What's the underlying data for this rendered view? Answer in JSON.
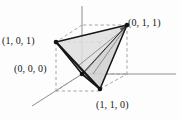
{
  "figure": {
    "type": "3d-geometry-diagram",
    "background_color": "#fdfdfd",
    "edge_color": "#1a1a1a",
    "face_fill": "#dcdcdc",
    "dashed_color": "#9a9a9a",
    "axis_color": "#8d8d8d"
  },
  "labels": {
    "v101": "(1, 0, 1)",
    "v011": "(0, 1, 1)",
    "v000": "(0, 0, 0)",
    "v110": "(1, 1, 0)"
  },
  "vertices": [
    {
      "name": "origin",
      "coord": "(0, 0, 0)",
      "px": [
        82,
        74
      ]
    },
    {
      "name": "top-left",
      "coord": "(1, 0, 1)",
      "px": [
        56,
        42
      ]
    },
    {
      "name": "top-right",
      "coord": "(0, 1, 1)",
      "px": [
        127,
        25
      ]
    },
    {
      "name": "bottom",
      "coord": "(1, 1, 0)",
      "px": [
        100,
        89
      ]
    }
  ],
  "axes": [
    {
      "name": "z-axis",
      "direction": "up"
    },
    {
      "name": "y-axis",
      "direction": "right"
    },
    {
      "name": "x-axis",
      "direction": "down-left"
    }
  ]
}
